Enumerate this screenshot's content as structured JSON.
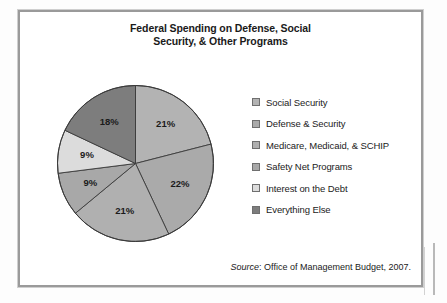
{
  "chart_data": {
    "type": "pie",
    "title": "Federal Spending on Defense, Social Security, & Other Programs",
    "title_line1": "Federal Spending on Defense, Social",
    "title_line2": "Security, & Other Programs",
    "categories": [
      "Social Security",
      "Defense & Security",
      "Medicare, Medicaid, & SCHIP",
      "Safety Net Programs",
      "Interest on the Debt",
      "Everything Else"
    ],
    "values": [
      21,
      22,
      21,
      9,
      9,
      18
    ],
    "value_labels": [
      "21%",
      "22%",
      "21%",
      "9%",
      "9%",
      "18%"
    ],
    "units": "percent",
    "colors": [
      "#b3b3b3",
      "#aaaaaa",
      "#b0b0b0",
      "#a8a8a8",
      "#dcdcdc",
      "#7d7d7d"
    ],
    "slice_start_angle_deg": 0,
    "direction": "clockwise",
    "legend_position": "right",
    "grid": false,
    "xlabel": "",
    "ylabel": "",
    "source": {
      "label": "Source",
      "text": ": Office of Management Budget, 2007."
    }
  },
  "legend": {
    "items": [
      {
        "label": "Social Security",
        "color": "#b3b3b3",
        "value_label": "21%"
      },
      {
        "label": "Defense & Security",
        "color": "#aaaaaa",
        "value_label": "22%"
      },
      {
        "label": "Medicare, Medicaid, & SCHIP",
        "color": "#b0b0b0",
        "value_label": "21%"
      },
      {
        "label": "Safety Net Programs",
        "color": "#a8a8a8",
        "value_label": "9%"
      },
      {
        "label": "Interest on the Debt",
        "color": "#dcdcdc",
        "value_label": "9%"
      },
      {
        "label": "Everything Else",
        "color": "#7d7d7d",
        "value_label": "18%"
      }
    ]
  }
}
